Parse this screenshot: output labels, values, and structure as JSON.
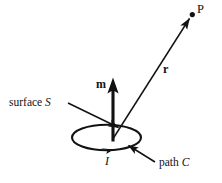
{
  "figure": {
    "kind": "physics-diagram",
    "width": 222,
    "height": 183,
    "background_color": "#ffffff",
    "ink_color": "#121212"
  },
  "labels": {
    "surface": {
      "prefix": "surface",
      "symbol": "S",
      "full": "surface S"
    },
    "path": {
      "prefix": "path",
      "symbol": "C",
      "full": "path C"
    },
    "moment_vector": "m",
    "position_vector": "r",
    "field_point": "P",
    "current": "I"
  },
  "elements": {
    "loop_name": "current-loop-ellipse",
    "moment_arrow_name": "magnetic-moment-arrow",
    "r_arrow_name": "position-vector-arrow",
    "current_arrow_name": "current-direction-arrowhead",
    "point_marker_name": "field-point-marker",
    "surface_leader_name": "surface-leader-line",
    "path_leader_name": "path-leader-line"
  }
}
